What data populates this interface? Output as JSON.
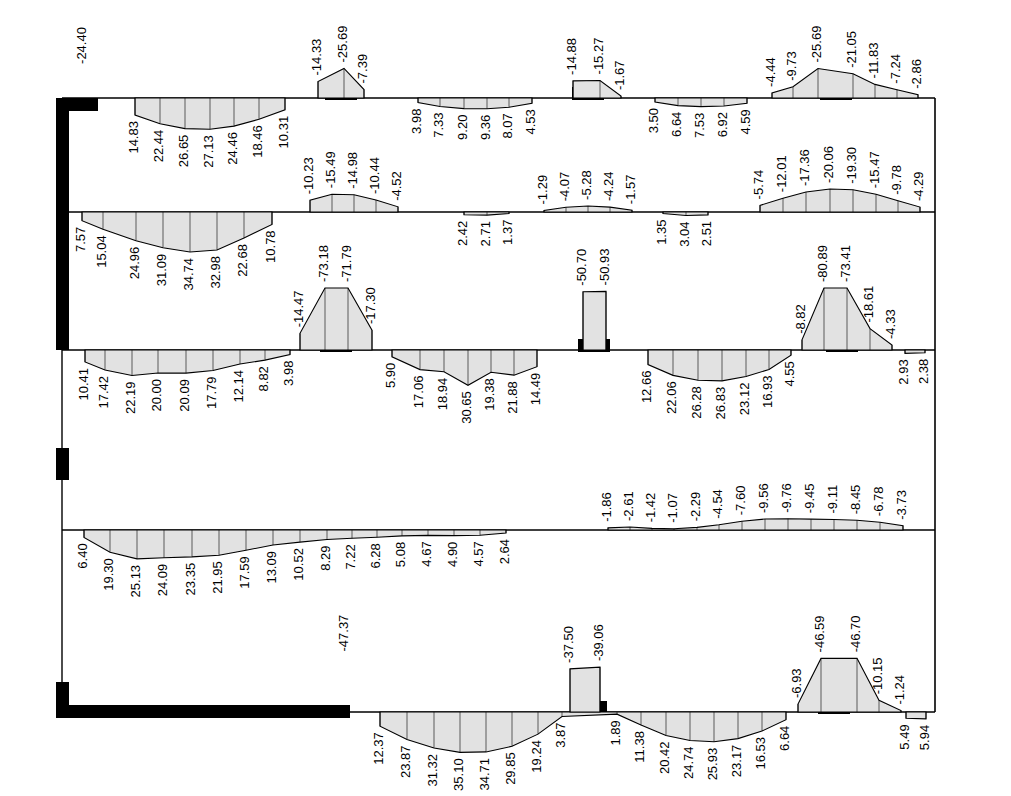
{
  "figure": {
    "kind": "bending-moment-diagram",
    "title": "",
    "units": "kN·m",
    "frame": {
      "left": 62,
      "right": 935,
      "top": 98,
      "bottom": 712,
      "levels_y": [
        98,
        212,
        350,
        455,
        530,
        712
      ]
    },
    "colors": {
      "line": "#000000",
      "fill": "#e2e2e2",
      "member": "#000000",
      "background": "#ffffff"
    }
  },
  "chart_data": {
    "type": "line",
    "xlabel": "",
    "ylabel": "Bending moment",
    "grid": false,
    "legend": "none",
    "levels": [
      {
        "name": "Level 1 (roof)",
        "y": 98,
        "labels_above": [
          {
            "text": "-24.40",
            "x": 83
          },
          {
            "text": "-14.33",
            "x": 318
          },
          {
            "text": "-25.69",
            "x": 344
          },
          {
            "text": "-7.39",
            "x": 364
          },
          {
            "text": "-14.88",
            "x": 573
          },
          {
            "text": "-15.27",
            "x": 600
          },
          {
            "text": "-1.67",
            "x": 621
          },
          {
            "text": "-4.44",
            "x": 772
          },
          {
            "text": "-9.73",
            "x": 793
          },
          {
            "text": "-25.69",
            "x": 818
          },
          {
            "text": "-21.05",
            "x": 853
          },
          {
            "text": "-11.83",
            "x": 875
          },
          {
            "text": "-7.24",
            "x": 897
          },
          {
            "text": "-2.86",
            "x": 918
          }
        ],
        "labels_below": [
          {
            "text": "14.83",
            "x": 135
          },
          {
            "text": "22.44",
            "x": 160
          },
          {
            "text": "26.65",
            "x": 185
          },
          {
            "text": "27.13",
            "x": 210
          },
          {
            "text": "24.46",
            "x": 234
          },
          {
            "text": "18.46",
            "x": 259
          },
          {
            "text": "10.31",
            "x": 285
          },
          {
            "text": "3.98",
            "x": 418
          },
          {
            "text": "7.33",
            "x": 440
          },
          {
            "text": "9.20",
            "x": 464
          },
          {
            "text": "9.36",
            "x": 487
          },
          {
            "text": "8.07",
            "x": 509
          },
          {
            "text": "4.53",
            "x": 532
          },
          {
            "text": "3.50",
            "x": 655
          },
          {
            "text": "6.64",
            "x": 678
          },
          {
            "text": "7.53",
            "x": 701
          },
          {
            "text": "6.92",
            "x": 724
          },
          {
            "text": "4.59",
            "x": 747
          }
        ]
      },
      {
        "name": "Level 2",
        "y": 212,
        "labels_above": [
          {
            "text": "-10.23",
            "x": 310
          },
          {
            "text": "-15.49",
            "x": 332
          },
          {
            "text": "-14.98",
            "x": 354
          },
          {
            "text": "-10.44",
            "x": 376
          },
          {
            "text": "-4.52",
            "x": 398
          },
          {
            "text": "-1.29",
            "x": 544
          },
          {
            "text": "-4.07",
            "x": 566
          },
          {
            "text": "-5.28",
            "x": 588
          },
          {
            "text": "-4.24",
            "x": 610
          },
          {
            "text": "-1.57",
            "x": 632
          },
          {
            "text": "-5.74",
            "x": 760
          },
          {
            "text": "-12.01",
            "x": 783
          },
          {
            "text": "-17.36",
            "x": 806
          },
          {
            "text": "-20.06",
            "x": 830
          },
          {
            "text": "-19.30",
            "x": 853
          },
          {
            "text": "-15.47",
            "x": 876
          },
          {
            "text": "-9.78",
            "x": 898
          },
          {
            "text": "-4.29",
            "x": 920
          }
        ],
        "labels_below": [
          {
            "text": "7.57",
            "x": 82
          },
          {
            "text": "15.04",
            "x": 103
          },
          {
            "text": "24.96",
            "x": 136
          },
          {
            "text": "31.09",
            "x": 163
          },
          {
            "text": "34.74",
            "x": 190
          },
          {
            "text": "32.98",
            "x": 217
          },
          {
            "text": "22.68",
            "x": 244
          },
          {
            "text": "10.78",
            "x": 272
          },
          {
            "text": "2.42",
            "x": 464
          },
          {
            "text": "2.71",
            "x": 487
          },
          {
            "text": "1.37",
            "x": 509
          },
          {
            "text": "1.35",
            "x": 663
          },
          {
            "text": "3.04",
            "x": 686
          },
          {
            "text": "2.51",
            "x": 708
          }
        ]
      },
      {
        "name": "Level 3",
        "y": 350,
        "labels_above": [
          {
            "text": "-14.47",
            "x": 300
          },
          {
            "text": "-73.18",
            "x": 325
          },
          {
            "text": "-71.79",
            "x": 348
          },
          {
            "text": "-17.30",
            "x": 372
          },
          {
            "text": "-50.70",
            "x": 583
          },
          {
            "text": "-50.93",
            "x": 606
          },
          {
            "text": "-8.82",
            "x": 802
          },
          {
            "text": "-80.89",
            "x": 824
          },
          {
            "text": "-73.41",
            "x": 847
          },
          {
            "text": "-18.61",
            "x": 870
          },
          {
            "text": "-4.33",
            "x": 892
          }
        ],
        "labels_below": [
          {
            "text": "10.41",
            "x": 85
          },
          {
            "text": "17.42",
            "x": 105
          },
          {
            "text": "22.19",
            "x": 132
          },
          {
            "text": "20.00",
            "x": 158
          },
          {
            "text": "20.09",
            "x": 186
          },
          {
            "text": "17.79",
            "x": 213
          },
          {
            "text": "12.14",
            "x": 240
          },
          {
            "text": "8.82",
            "x": 265
          },
          {
            "text": "3.98",
            "x": 290
          },
          {
            "text": "5.90",
            "x": 392
          },
          {
            "text": "17.06",
            "x": 420
          },
          {
            "text": "18.94",
            "x": 444
          },
          {
            "text": "30.65",
            "x": 468
          },
          {
            "text": "19.38",
            "x": 491
          },
          {
            "text": "21.88",
            "x": 514
          },
          {
            "text": "14.49",
            "x": 537
          },
          {
            "text": "12.66",
            "x": 648
          },
          {
            "text": "22.06",
            "x": 673
          },
          {
            "text": "26.28",
            "x": 698
          },
          {
            "text": "26.83",
            "x": 722
          },
          {
            "text": "23.12",
            "x": 746
          },
          {
            "text": "16.93",
            "x": 769
          },
          {
            "text": "4.55",
            "x": 791
          },
          {
            "text": "2.93",
            "x": 905
          },
          {
            "text": "2.38",
            "x": 925
          }
        ]
      },
      {
        "name": "Level 4",
        "y": 530,
        "labels_above": [
          {
            "text": "-1.86",
            "x": 608
          },
          {
            "text": "-2.61",
            "x": 630
          },
          {
            "text": "-1.42",
            "x": 652
          },
          {
            "text": "-1.07",
            "x": 674
          },
          {
            "text": "-2.29",
            "x": 697
          },
          {
            "text": "-4.54",
            "x": 719
          },
          {
            "text": "-7.60",
            "x": 742
          },
          {
            "text": "-9.56",
            "x": 765
          },
          {
            "text": "-9.76",
            "x": 788
          },
          {
            "text": "-9.45",
            "x": 811
          },
          {
            "text": "-9.11",
            "x": 834
          },
          {
            "text": "-8.45",
            "x": 857
          },
          {
            "text": "-6.78",
            "x": 880
          },
          {
            "text": "-3.73",
            "x": 903
          }
        ],
        "labels_below": [
          {
            "text": "6.40",
            "x": 84
          },
          {
            "text": "19.30",
            "x": 110
          },
          {
            "text": "25.13",
            "x": 137
          },
          {
            "text": "24.09",
            "x": 164
          },
          {
            "text": "23.35",
            "x": 192
          },
          {
            "text": "21.95",
            "x": 219
          },
          {
            "text": "17.59",
            "x": 246
          },
          {
            "text": "13.09",
            "x": 273
          },
          {
            "text": "10.52",
            "x": 300
          },
          {
            "text": "8.29",
            "x": 327
          },
          {
            "text": "7.22",
            "x": 352
          },
          {
            "text": "6.28",
            "x": 377
          },
          {
            "text": "5.08",
            "x": 402
          },
          {
            "text": "4.67",
            "x": 428
          },
          {
            "text": "4.90",
            "x": 454
          },
          {
            "text": "4.57",
            "x": 480
          },
          {
            "text": "2.64",
            "x": 506
          }
        ]
      },
      {
        "name": "Level 5 (ground)",
        "y": 712,
        "labels_above": [
          {
            "text": "-47.37",
            "x": 345
          },
          {
            "text": "-37.50",
            "x": 570
          },
          {
            "text": "-39.06",
            "x": 600
          },
          {
            "text": "-6.93",
            "x": 798
          },
          {
            "text": "-46.59",
            "x": 821
          },
          {
            "text": "-46.70",
            "x": 857
          },
          {
            "text": "-10.15",
            "x": 879
          },
          {
            "text": "-1.24",
            "x": 901
          }
        ],
        "labels_below": [
          {
            "text": "12.37",
            "x": 380
          },
          {
            "text": "23.87",
            "x": 407
          },
          {
            "text": "31.32",
            "x": 434
          },
          {
            "text": "35.10",
            "x": 460
          },
          {
            "text": "34.71",
            "x": 486
          },
          {
            "text": "29.85",
            "x": 512
          },
          {
            "text": "19.24",
            "x": 538
          },
          {
            "text": "3.87",
            "x": 562
          },
          {
            "text": "1.89",
            "x": 617
          },
          {
            "text": "11.38",
            "x": 641
          },
          {
            "text": "20.42",
            "x": 666
          },
          {
            "text": "24.74",
            "x": 690
          },
          {
            "text": "25.93",
            "x": 714
          },
          {
            "text": "23.17",
            "x": 738
          },
          {
            "text": "16.53",
            "x": 762
          },
          {
            "text": "6.64",
            "x": 786
          },
          {
            "text": "5.49",
            "x": 906
          },
          {
            "text": "5.94",
            "x": 926
          }
        ]
      }
    ],
    "columns": [
      {
        "level": 1,
        "x1": 325,
        "x2": 357,
        "y": 98
      },
      {
        "level": 1,
        "x1": 572,
        "x2": 604,
        "y": 98
      },
      {
        "level": 1,
        "x1": 820,
        "x2": 852,
        "y": 98
      },
      {
        "level": 2,
        "x1": 0,
        "x2": 0,
        "y": 212
      },
      {
        "level": 3,
        "x1": 320,
        "x2": 352,
        "y": 350
      },
      {
        "level": 3,
        "x1": 578,
        "x2": 610,
        "y": 350
      },
      {
        "level": 3,
        "x1": 826,
        "x2": 858,
        "y": 350
      },
      {
        "level": 5,
        "x1": 575,
        "x2": 607,
        "y": 712
      },
      {
        "level": 5,
        "x1": 818,
        "x2": 850,
        "y": 712
      }
    ],
    "walls": [
      {
        "name": "left-shear-wall-upper",
        "x": 62,
        "y1": 98,
        "y2": 350,
        "thickness": 13
      },
      {
        "name": "left-column-stub",
        "x": 62,
        "y1": 448,
        "y2": 478,
        "thickness": 13
      },
      {
        "name": "left-base",
        "x": 62,
        "y1": 682,
        "y2": 712,
        "thickness": 13
      },
      {
        "name": "roof-left-cap",
        "x1": 62,
        "x2": 98,
        "y": 98
      },
      {
        "name": "ground-slab",
        "x1": 55,
        "x2": 350,
        "y": 712
      }
    ]
  }
}
